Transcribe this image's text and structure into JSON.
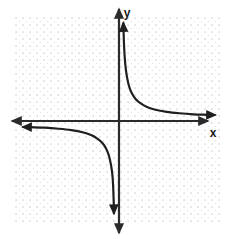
{
  "figure": {
    "name": "hyperbola-graph",
    "background_color": "#ffffff",
    "width": 235,
    "height": 239
  },
  "grid": {
    "style": "dotted",
    "dot_color": "#b4b4b4",
    "spacing_px": 7,
    "left": 16,
    "top": 18,
    "right": 219,
    "bottom": 222,
    "columns": 29,
    "rows": 29,
    "visible": true
  },
  "axes": {
    "color": "#2b2b2b",
    "stroke_width": 2.2,
    "origin": {
      "x": 119,
      "y": 121
    },
    "x_axis": {
      "label": "x",
      "label_x": 213,
      "label_y": 137,
      "start_x": 12,
      "end_x": 208,
      "y": 121,
      "arrow_start": true,
      "arrow_end": true
    },
    "y_axis": {
      "label": "y",
      "label_x": 127,
      "label_y": 17,
      "x": 119,
      "start_y": 9,
      "end_y": 233,
      "arrow_start": true,
      "arrow_end": true
    }
  },
  "chart_data": {
    "type": "line",
    "title": "",
    "xlabel": "x",
    "ylabel": "y",
    "function": "y = k/x",
    "xlim": [
      -14.5,
      14.5
    ],
    "ylim": [
      -14.5,
      14.5
    ],
    "grid": true,
    "legend": null,
    "curve_color": "#1f1f1f",
    "curve_width": 2.2,
    "asymptotes": {
      "vertical": 0,
      "horizontal": 0
    },
    "series": [
      {
        "name": "branch-quadrant-1",
        "quadrant": 1,
        "arrow_start": true,
        "arrow_end": true,
        "points": [
          [
            0.62,
            14.0
          ],
          [
            0.66,
            12.5
          ],
          [
            0.72,
            10.8
          ],
          [
            0.82,
            9.0
          ],
          [
            0.95,
            7.6
          ],
          [
            1.15,
            6.2
          ],
          [
            1.45,
            4.9
          ],
          [
            1.85,
            3.9
          ],
          [
            2.4,
            3.1
          ],
          [
            3.1,
            2.5
          ],
          [
            4.0,
            2.0
          ],
          [
            5.2,
            1.6
          ],
          [
            6.8,
            1.3
          ],
          [
            8.6,
            1.1
          ],
          [
            10.6,
            0.95
          ],
          [
            12.6,
            0.88
          ],
          [
            13.8,
            0.85
          ]
        ]
      },
      {
        "name": "branch-quadrant-3",
        "quadrant": 3,
        "arrow_start": true,
        "arrow_end": true,
        "points": [
          [
            -13.8,
            -0.85
          ],
          [
            -12.6,
            -0.88
          ],
          [
            -10.6,
            -0.95
          ],
          [
            -8.6,
            -1.1
          ],
          [
            -6.8,
            -1.3
          ],
          [
            -5.2,
            -1.6
          ],
          [
            -4.0,
            -2.0
          ],
          [
            -3.1,
            -2.5
          ],
          [
            -2.4,
            -3.1
          ],
          [
            -1.85,
            -3.9
          ],
          [
            -1.45,
            -4.9
          ],
          [
            -1.15,
            -6.2
          ],
          [
            -0.95,
            -7.6
          ],
          [
            -0.85,
            -9.0
          ],
          [
            -0.78,
            -10.8
          ],
          [
            -0.74,
            -12.0
          ],
          [
            -0.72,
            -13.2
          ]
        ]
      }
    ]
  }
}
